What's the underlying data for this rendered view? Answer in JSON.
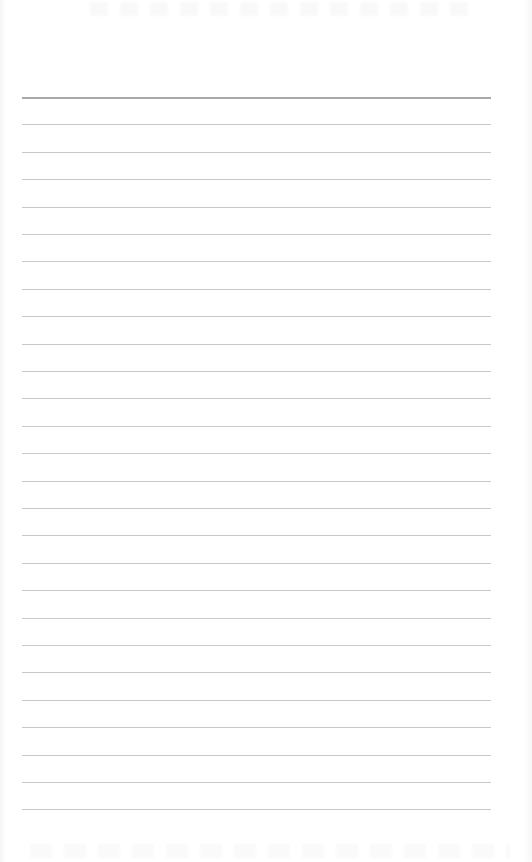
{
  "page": {
    "type": "lined-paper",
    "background_color": "#ffffff",
    "line_color": "#c9c9c9",
    "first_line_color": "#a9a9a9",
    "line_count": 27,
    "first_line_y": 97,
    "line_spacing": 27.4,
    "line_left": 22,
    "line_right": 491,
    "text": ""
  }
}
